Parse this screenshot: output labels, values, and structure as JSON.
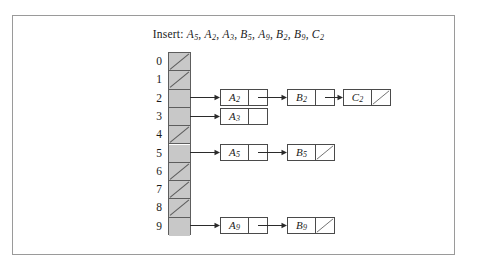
{
  "figure": {
    "caption": {
      "label": "Insert:",
      "items": [
        {
          "letter": "A",
          "sub": "5"
        },
        {
          "letter": "A",
          "sub": "2"
        },
        {
          "letter": "A",
          "sub": "3"
        },
        {
          "letter": "B",
          "sub": "5"
        },
        {
          "letter": "A",
          "sub": "9"
        },
        {
          "letter": "B",
          "sub": "2"
        },
        {
          "letter": "B",
          "sub": "9"
        },
        {
          "letter": "C",
          "sub": "2"
        }
      ]
    },
    "colors": {
      "cell_fill": "#c8c8c8",
      "cell_stroke": "#5d5d5d",
      "node_stroke": "#4a4a4a",
      "frame_stroke": "#9a9a9a",
      "background": "#ffffff",
      "arrow": "#2b2b2b"
    },
    "array": {
      "buckets": [
        {
          "index": "0",
          "empty": true,
          "chain": []
        },
        {
          "index": "1",
          "empty": true,
          "chain": []
        },
        {
          "index": "2",
          "empty": false,
          "chain": [
            {
              "letter": "A",
              "sub": "2",
              "pointer": "link"
            },
            {
              "letter": "B",
              "sub": "2",
              "pointer": "link"
            },
            {
              "letter": "C",
              "sub": "2",
              "pointer": "null"
            }
          ]
        },
        {
          "index": "3",
          "empty": false,
          "chain": [
            {
              "letter": "A",
              "sub": "3",
              "pointer": "blank"
            }
          ]
        },
        {
          "index": "4",
          "empty": true,
          "chain": []
        },
        {
          "index": "5",
          "empty": false,
          "chain": [
            {
              "letter": "A",
              "sub": "5",
              "pointer": "link"
            },
            {
              "letter": "B",
              "sub": "5",
              "pointer": "null"
            }
          ]
        },
        {
          "index": "6",
          "empty": true,
          "chain": []
        },
        {
          "index": "7",
          "empty": true,
          "chain": []
        },
        {
          "index": "8",
          "empty": true,
          "chain": []
        },
        {
          "index": "9",
          "empty": false,
          "chain": [
            {
              "letter": "A",
              "sub": "9",
              "pointer": "link"
            },
            {
              "letter": "B",
              "sub": "9",
              "pointer": "null"
            }
          ]
        }
      ]
    }
  }
}
